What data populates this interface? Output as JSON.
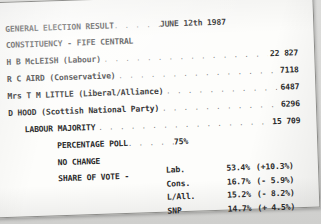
{
  "document": {
    "title": "GENERAL ELECTION RESULT",
    "date": "JUNE 12th 1987",
    "constituency": "CONSTITUENCY - FIFE CENTRAL",
    "leader_dots_title": ". . . . . .",
    "leader_dots": ". . . . . . . . . . . . . . . . . . . . . . . .",
    "candidates": [
      {
        "name": "H B McLEISH (Labour)",
        "votes": "22 827"
      },
      {
        "name": "R C AIRD (Conservative)",
        "votes": "7118"
      },
      {
        "name": "Mrs T M LITTLE (Liberal/Alliance)",
        "votes": "6487"
      },
      {
        "name": "D HOOD (Scottish National Party)",
        "votes": "6296"
      }
    ],
    "majority": {
      "label": "LABOUR MAJORITY",
      "value": "15 709"
    },
    "percentage_poll": {
      "label": "PERCENTAGE POLL",
      "leader": ". . . . . .",
      "value": "75%"
    },
    "no_change": "NO CHANGE",
    "share_of_vote_label": "SHARE OF VOTE -",
    "share_of_vote": [
      {
        "party": "Lab.",
        "share": "53.4%",
        "change": "(+10.3%)"
      },
      {
        "party": "Cons.",
        "share": "16.7%",
        "change": "(- 5.9%)"
      },
      {
        "party": "L/All.",
        "share": "15.2%",
        "change": "(- 8.2%)"
      },
      {
        "party": "SNP",
        "share": "14.7%",
        "change": "(+ 4.5%)"
      }
    ]
  },
  "colors": {
    "paper": "#fdfdfb",
    "ink": "#2b2b2b",
    "background": "#d9d9d7"
  }
}
